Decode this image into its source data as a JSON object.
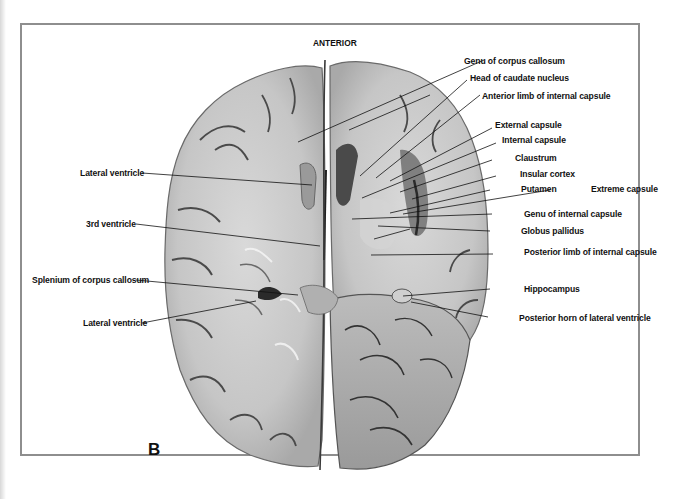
{
  "figure": {
    "orientation_label": "ANTERIOR",
    "panel_letter": "B"
  },
  "labels_left": [
    {
      "id": "lateral-ventricle-upper",
      "text": "Lateral ventricle"
    },
    {
      "id": "third-ventricle",
      "text": "3rd ventricle"
    },
    {
      "id": "splenium-corpus-callosum",
      "text": "Splenium of corpus callosum"
    },
    {
      "id": "lateral-ventricle-lower",
      "text": "Lateral ventricle"
    }
  ],
  "labels_right": [
    {
      "id": "genu-corpus-callosum",
      "text": "Genu of corpus callosum"
    },
    {
      "id": "head-caudate-nucleus",
      "text": "Head of caudate nucleus"
    },
    {
      "id": "anterior-limb-internal-capsule",
      "text": "Anterior limb of internal capsule"
    },
    {
      "id": "external-capsule",
      "text": "External capsule"
    },
    {
      "id": "internal-capsule",
      "text": "Internal capsule"
    },
    {
      "id": "claustrum",
      "text": "Claustrum"
    },
    {
      "id": "insular-cortex",
      "text": "Insular cortex"
    },
    {
      "id": "putamen",
      "text": "Putamen"
    },
    {
      "id": "extreme-capsule",
      "text": "Extreme capsule"
    },
    {
      "id": "genu-internal-capsule",
      "text": "Genu of internal capsule"
    },
    {
      "id": "globus-pallidus",
      "text": "Globus pallidus"
    },
    {
      "id": "posterior-limb-internal-capsule",
      "text": "Posterior limb of internal capsule"
    },
    {
      "id": "hippocampus",
      "text": "Hippocampus"
    },
    {
      "id": "posterior-horn-lateral-ventricle",
      "text": "Posterior horn of lateral ventricle"
    }
  ],
  "colors": {
    "tissue": "#c9c9c9",
    "tissue_light": "#dedede",
    "sulcus": "#3a3a3a",
    "frame": "#8e8e8e",
    "text": "#111111"
  }
}
